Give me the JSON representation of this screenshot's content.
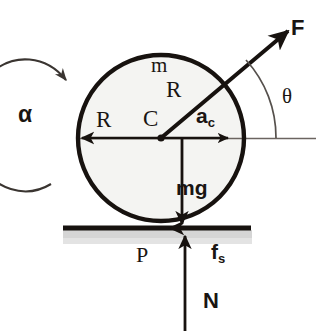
{
  "diagram": {
    "type": "free-body-diagram",
    "body_shape": "circle",
    "colors": {
      "ink": "#1a1512",
      "outline": "#17120f",
      "ground_shade": "#d5d5d5",
      "thin_line": "#55504c",
      "background": "#ffffff"
    },
    "geometry": {
      "center": {
        "x": 161,
        "y": 138,
        "label": "C"
      },
      "radius_px": 84,
      "ground_line_y": 228,
      "ground_line_x1": 63,
      "ground_line_x2": 251,
      "contact_point": {
        "x": 183,
        "y": 228,
        "label": "P"
      },
      "horizontal_axis_x1": 78,
      "horizontal_axis_x2": 316,
      "force_angle_deg": 40
    },
    "labels": {
      "force_F": "F",
      "mass_m": "m",
      "radius_diag": "R",
      "angle_theta": "θ",
      "radius_left": "R",
      "center_C": "C",
      "accel_base": "a",
      "accel_sub": "c",
      "angular_accel": "α",
      "weight_mg": "mg",
      "contact_P": "P",
      "friction_base": "f",
      "friction_sub": "s",
      "normal_N": "N"
    },
    "vectors": [
      {
        "name": "applied-force",
        "label": "F",
        "from": "C",
        "direction": "up-right",
        "angle_deg": 40
      },
      {
        "name": "radius-to-force",
        "label": "R",
        "from": "C",
        "direction": "up-right"
      },
      {
        "name": "radius-left",
        "label": "R",
        "from": "C",
        "direction": "left"
      },
      {
        "name": "center-acceleration",
        "label": "a_c",
        "from": "C",
        "direction": "right"
      },
      {
        "name": "weight",
        "label": "mg",
        "from": "C",
        "direction": "down"
      },
      {
        "name": "static-friction",
        "label": "f_s",
        "from": "P",
        "direction": "left"
      },
      {
        "name": "normal-force",
        "label": "N",
        "from": "P",
        "direction": "up"
      },
      {
        "name": "angular-acceleration",
        "label": "α",
        "direction": "counterclockwise"
      }
    ]
  }
}
